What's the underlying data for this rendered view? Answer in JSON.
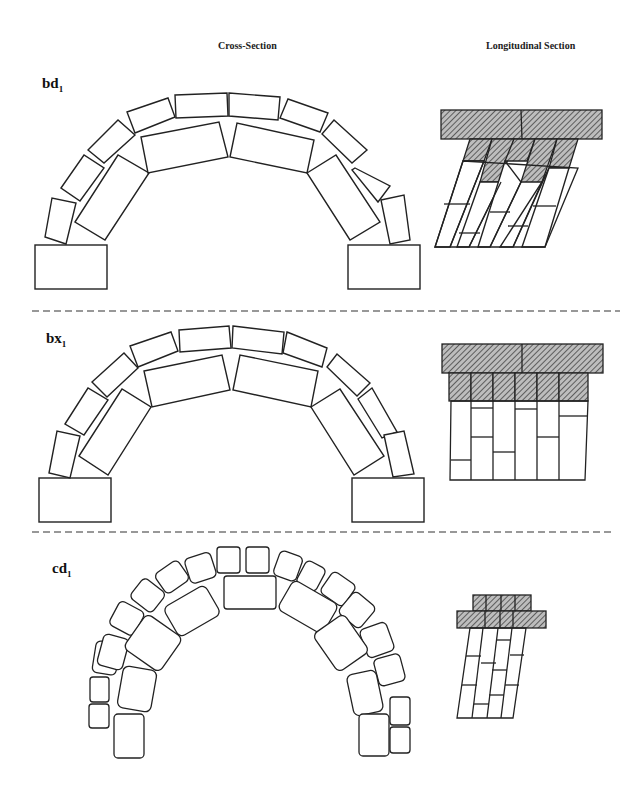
{
  "columns": {
    "cross_section": "Cross-Section",
    "longitudinal_section": "Longitudinal  Section"
  },
  "rows": [
    {
      "id": "bd",
      "label": "bd",
      "subscript": "1",
      "description": "Two-ring rectangular block arch with inclined (raking) longitudinal courses"
    },
    {
      "id": "bx",
      "label": "bx",
      "subscript": "1",
      "description": "Two-ring rectangular block arch with vertical longitudinal courses"
    },
    {
      "id": "cd",
      "label": "cd",
      "subscript": "1",
      "description": "Two-ring rough-cut stone arch with inclined longitudinal courses"
    }
  ],
  "legend": {
    "hatched": "Hatched fill indicates cut/sectioned blocks in longitudinal section"
  },
  "colors": {
    "stroke": "#222222",
    "background": "#ffffff",
    "hatch": "#555555"
  }
}
